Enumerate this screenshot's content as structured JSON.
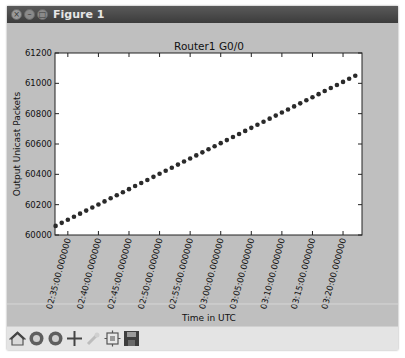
{
  "window": {
    "title": "Figure 1",
    "buttons": [
      "close",
      "minimize",
      "maximize"
    ]
  },
  "toolbar": {
    "buttons": [
      {
        "name": "home",
        "icon": "home-icon"
      },
      {
        "name": "back",
        "icon": "back-arrow-icon"
      },
      {
        "name": "forward",
        "icon": "forward-arrow-icon"
      },
      {
        "name": "pan",
        "icon": "pan-move-icon"
      },
      {
        "name": "zoom",
        "icon": "zoom-rect-icon"
      },
      {
        "name": "subplots",
        "icon": "configure-subplots-icon"
      },
      {
        "name": "save",
        "icon": "save-floppy-icon"
      }
    ]
  },
  "chart_data": {
    "type": "scatter",
    "title": "Router1 G0/0",
    "xlabel": "Time in UTC",
    "ylabel": "Output Unicast Packets",
    "ylim": [
      60000,
      61200
    ],
    "yticks": [
      "60000",
      "60200",
      "60400",
      "60600",
      "60800",
      "61000",
      "61200"
    ],
    "xticks": [
      "02:35:00.000000",
      "02:40:00.000000",
      "02:45:00.000000",
      "02:50:00.000000",
      "02:55:00.000000",
      "03:00:00.000000",
      "03:05:00.000000",
      "03:10:00.000000",
      "03:15:00.000000",
      "03:20:00.000000"
    ],
    "xrange_minutes": [
      "02:33",
      "03:23"
    ],
    "grid": false,
    "marker_color": "#2a2a2a",
    "x_start": "02:33",
    "x_interval_minutes": 1,
    "point_count": 50,
    "y_start": 60060,
    "y_end": 61050,
    "note": "Points every minute, roughly linear increase ~20 packets/min"
  }
}
